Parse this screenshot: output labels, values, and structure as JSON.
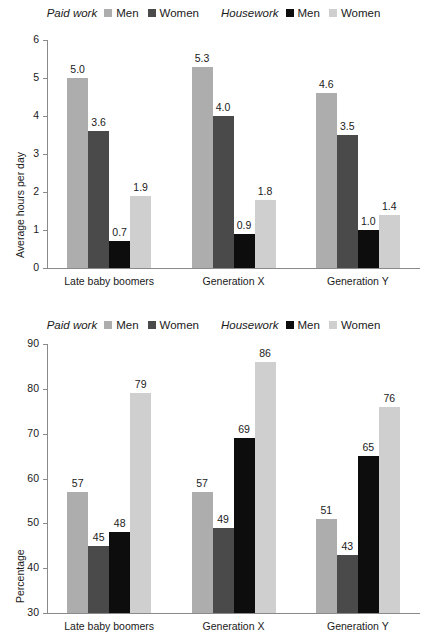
{
  "legend": {
    "groups": [
      {
        "title": "Paid work",
        "entries": [
          {
            "label": "Men",
            "color": "#adadad"
          },
          {
            "label": "Women",
            "color": "#4a4a4a"
          }
        ]
      },
      {
        "title": "Housework",
        "entries": [
          {
            "label": "Men",
            "color": "#0d0d0d"
          },
          {
            "label": "Women",
            "color": "#cfcfcf"
          }
        ]
      }
    ]
  },
  "chart_data": [
    {
      "type": "bar",
      "title": "",
      "xlabel": "",
      "ylabel": "Average hours per day",
      "categories": [
        "Late baby boomers",
        "Generation X",
        "Generation Y"
      ],
      "ylim": [
        0,
        6
      ],
      "yticks": [
        "0",
        "1",
        "2",
        "3",
        "4",
        "5",
        "6"
      ],
      "grid": false,
      "legend_position": "top",
      "series": [
        {
          "name": "Paid work Men",
          "color": "#adadad",
          "values": [
            5.0,
            5.3,
            4.6
          ],
          "labels": [
            "5.0",
            "5.3",
            "4.6"
          ]
        },
        {
          "name": "Paid work Women",
          "color": "#4a4a4a",
          "values": [
            3.6,
            4.0,
            3.5
          ],
          "labels": [
            "3.6",
            "4.0",
            "3.5"
          ]
        },
        {
          "name": "Housework Men",
          "color": "#0d0d0d",
          "values": [
            0.7,
            0.9,
            1.0
          ],
          "labels": [
            "0.7",
            "0.9",
            "1.0"
          ]
        },
        {
          "name": "Housework Women",
          "color": "#cfcfcf",
          "values": [
            1.9,
            1.8,
            1.4
          ],
          "labels": [
            "1.9",
            "1.8",
            "1.4"
          ]
        }
      ]
    },
    {
      "type": "bar",
      "title": "",
      "xlabel": "",
      "ylabel": "Percentage",
      "categories": [
        "Late baby boomers",
        "Generation X",
        "Generation Y"
      ],
      "ylim": [
        30,
        90
      ],
      "yticks": [
        "30",
        "40",
        "50",
        "60",
        "70",
        "80",
        "90"
      ],
      "grid": false,
      "legend_position": "top",
      "series": [
        {
          "name": "Paid work Men",
          "color": "#adadad",
          "values": [
            57,
            57,
            51
          ],
          "labels": [
            "57",
            "57",
            "51"
          ]
        },
        {
          "name": "Paid work Women",
          "color": "#4a4a4a",
          "values": [
            45,
            49,
            43
          ],
          "labels": [
            "45",
            "49",
            "43"
          ]
        },
        {
          "name": "Housework Men",
          "color": "#0d0d0d",
          "values": [
            48,
            69,
            65
          ],
          "labels": [
            "48",
            "69",
            "65"
          ]
        },
        {
          "name": "Housework Women",
          "color": "#cfcfcf",
          "values": [
            79,
            86,
            76
          ],
          "labels": [
            "79",
            "86",
            "76"
          ]
        }
      ]
    }
  ]
}
